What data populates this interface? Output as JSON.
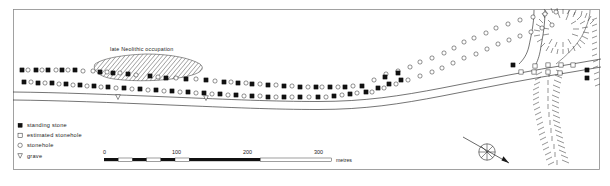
{
  "figure": {
    "kind": "archaeological-site-plan",
    "orientation_marker": "north-arrow"
  },
  "annotations": {
    "occupation_label": "late Neolithic occupation"
  },
  "legend": {
    "items": [
      {
        "symbol": "filled-square",
        "icon_name": "standing-stone-icon",
        "label": "standing stone"
      },
      {
        "symbol": "open-square",
        "icon_name": "estimated-stonehole-icon",
        "label": "estimated stonehole"
      },
      {
        "symbol": "open-circle",
        "icon_name": "stonehole-icon",
        "label": "stonehole"
      },
      {
        "symbol": "down-triangle",
        "icon_name": "grave-icon",
        "label": "grave"
      }
    ]
  },
  "scalebar": {
    "ticks": [
      "0",
      "100",
      "200",
      "300"
    ],
    "unit": "metres",
    "segments_per_100m": 5,
    "total_metres": 300
  },
  "colors": {
    "ink": "#1a1a1a",
    "line": "#2a2a2a",
    "frame": "#8b8b8b",
    "paper": "#ffffff",
    "hatch": "#3a3a3a"
  },
  "chart_data": {
    "type": "scatter",
    "title": "",
    "xlabel": "",
    "ylabel": "",
    "note": "Plan of megalithic stone rows: two roughly parallel alignments running WSW-ENE, fanning apart toward the ENE; filled squares = upstanding stones, open circles = excavated stoneholes, open squares = estimated stoneholes.",
    "series": [
      {
        "name": "north-row-standing-stone",
        "symbol": "filled-square",
        "points": [
          [
            22,
            70
          ],
          [
            36,
            70
          ],
          [
            48,
            70
          ],
          [
            62,
            70
          ],
          [
            75,
            70
          ],
          [
            100,
            72
          ],
          [
            113,
            73
          ],
          [
            128,
            74
          ],
          [
            150,
            76
          ],
          [
            166,
            78
          ],
          [
            186,
            79
          ],
          [
            206,
            80
          ],
          [
            224,
            82
          ],
          [
            238,
            83
          ],
          [
            252,
            84
          ],
          [
            268,
            85
          ],
          [
            284,
            86
          ],
          [
            300,
            87
          ],
          [
            316,
            87
          ],
          [
            330,
            87
          ],
          [
            345,
            87
          ],
          [
            362,
            86
          ]
        ]
      },
      {
        "name": "north-row-stonehole",
        "symbol": "open-circle",
        "points": [
          [
            28,
            70
          ],
          [
            42,
            70
          ],
          [
            56,
            70
          ],
          [
            68,
            70
          ],
          [
            83,
            71
          ],
          [
            93,
            71
          ],
          [
            107,
            72
          ],
          [
            120,
            73
          ],
          [
            136,
            75
          ],
          [
            158,
            77
          ],
          [
            176,
            78
          ],
          [
            196,
            79
          ],
          [
            215,
            81
          ],
          [
            231,
            82
          ],
          [
            246,
            83
          ],
          [
            260,
            84
          ],
          [
            276,
            85
          ],
          [
            292,
            86
          ],
          [
            308,
            87
          ],
          [
            322,
            87
          ],
          [
            338,
            87
          ],
          [
            353,
            86
          ]
        ]
      },
      {
        "name": "south-row-standing-stone",
        "symbol": "filled-square",
        "points": [
          [
            24,
            82
          ],
          [
            38,
            83
          ],
          [
            52,
            83
          ],
          [
            66,
            84
          ],
          [
            80,
            85
          ],
          [
            94,
            86
          ],
          [
            108,
            87
          ],
          [
            124,
            88
          ],
          [
            140,
            89
          ],
          [
            156,
            90
          ],
          [
            172,
            91
          ],
          [
            188,
            92
          ],
          [
            204,
            93
          ],
          [
            220,
            94
          ],
          [
            236,
            95
          ],
          [
            252,
            96
          ],
          [
            268,
            97
          ],
          [
            284,
            97
          ],
          [
            300,
            97
          ],
          [
            318,
            97
          ],
          [
            334,
            96
          ],
          [
            350,
            94
          ]
        ]
      },
      {
        "name": "south-row-stonehole",
        "symbol": "open-circle",
        "points": [
          [
            31,
            82
          ],
          [
            45,
            83
          ],
          [
            59,
            84
          ],
          [
            73,
            85
          ],
          [
            87,
            86
          ],
          [
            101,
            87
          ],
          [
            116,
            88
          ],
          [
            132,
            89
          ],
          [
            148,
            90
          ],
          [
            164,
            91
          ],
          [
            180,
            92
          ],
          [
            196,
            93
          ],
          [
            212,
            94
          ],
          [
            228,
            95
          ],
          [
            244,
            96
          ],
          [
            260,
            96
          ],
          [
            276,
            97
          ],
          [
            292,
            97
          ],
          [
            309,
            97
          ],
          [
            326,
            97
          ],
          [
            342,
            95
          ],
          [
            357,
            93
          ]
        ]
      },
      {
        "name": "ne-fan-upper-stonehole",
        "symbol": "open-circle",
        "points": [
          [
            374,
            80
          ],
          [
            386,
            74
          ],
          [
            398,
            71
          ],
          [
            410,
            67
          ],
          [
            420,
            62
          ],
          [
            432,
            58
          ],
          [
            444,
            53
          ],
          [
            454,
            48
          ],
          [
            464,
            42
          ],
          [
            474,
            38
          ],
          [
            486,
            33
          ],
          [
            496,
            28
          ],
          [
            508,
            24
          ],
          [
            520,
            20
          ],
          [
            533,
            17
          ],
          [
            545,
            14
          ],
          [
            556,
            12
          ]
        ]
      },
      {
        "name": "ne-fan-lower-stonehole",
        "symbol": "open-circle",
        "points": [
          [
            372,
            92
          ],
          [
            384,
            88
          ],
          [
            396,
            84
          ],
          [
            408,
            80
          ],
          [
            420,
            76
          ],
          [
            432,
            72
          ],
          [
            442,
            68
          ],
          [
            453,
            63
          ],
          [
            464,
            58
          ],
          [
            476,
            54
          ],
          [
            487,
            49
          ],
          [
            498,
            44
          ],
          [
            509,
            40
          ],
          [
            520,
            36
          ],
          [
            531,
            32
          ],
          [
            542,
            28
          ],
          [
            552,
            25
          ]
        ]
      },
      {
        "name": "ne-standing-stone",
        "symbol": "filled-square",
        "points": [
          [
            366,
            92
          ],
          [
            378,
            88
          ],
          [
            389,
            84
          ],
          [
            401,
            80
          ],
          [
            385,
            77
          ],
          [
            398,
            73
          ]
        ]
      },
      {
        "name": "roadside-marker",
        "symbol": "open-square",
        "points": [
          [
            535,
            66
          ],
          [
            548,
            65
          ],
          [
            561,
            65
          ],
          [
            573,
            65
          ],
          [
            521,
            72
          ],
          [
            534,
            72
          ],
          [
            548,
            72
          ],
          [
            560,
            73
          ]
        ]
      },
      {
        "name": "roadside-standing-stone",
        "symbol": "filled-square",
        "points": [
          [
            513,
            65
          ],
          [
            587,
            70
          ],
          [
            587,
            78
          ]
        ]
      },
      {
        "name": "grave",
        "symbol": "down-triangle",
        "points": [
          [
            206,
            98
          ],
          [
            118,
            97
          ]
        ]
      }
    ],
    "occupation_zone": {
      "label": "late Neolithic occupation",
      "fill": "hatched-diagonal",
      "outline": [
        [
          96,
          62
        ],
        [
          118,
          57
        ],
        [
          146,
          55
        ],
        [
          172,
          57
        ],
        [
          192,
          62
        ],
        [
          202,
          68
        ],
        [
          196,
          74
        ],
        [
          176,
          78
        ],
        [
          150,
          80
        ],
        [
          122,
          79
        ],
        [
          102,
          74
        ],
        [
          94,
          68
        ]
      ]
    },
    "roads": [
      {
        "name": "main-road-north-kerb",
        "path": [
          [
            14,
            92
          ],
          [
            80,
            93
          ],
          [
            160,
            96
          ],
          [
            240,
            99
          ],
          [
            300,
            101
          ],
          [
            360,
            100
          ],
          [
            420,
            92
          ],
          [
            480,
            80
          ],
          [
            530,
            70
          ],
          [
            575,
            64
          ],
          [
            600,
            60
          ]
        ]
      },
      {
        "name": "main-road-south-kerb",
        "path": [
          [
            14,
            100
          ],
          [
            80,
            101
          ],
          [
            160,
            104
          ],
          [
            240,
            107
          ],
          [
            300,
            109
          ],
          [
            360,
            108
          ],
          [
            420,
            100
          ],
          [
            480,
            88
          ],
          [
            530,
            78
          ],
          [
            575,
            72
          ],
          [
            600,
            68
          ]
        ]
      }
    ],
    "axis_note": "coordinates are plan pixels, origin top-left of frame"
  }
}
